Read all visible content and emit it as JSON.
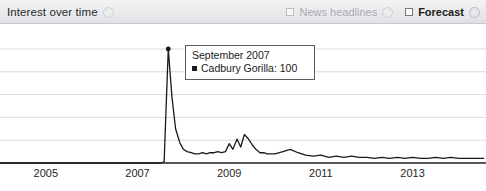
{
  "header": {
    "title": "Interest over time",
    "help_icon": "help-circle-icon",
    "controls": [
      {
        "name": "news-headlines",
        "label": "News headlines",
        "checked": false,
        "disabled": true,
        "help_icon": "help-circle-icon"
      },
      {
        "name": "forecast",
        "label": "Forecast",
        "checked": false,
        "disabled": false,
        "help_icon": "help-circle-icon"
      }
    ]
  },
  "tooltip": {
    "date": "September 2007",
    "series_label": "Cadbury Gorilla",
    "value": "100",
    "row_text": "Cadbury Gorilla: 100"
  },
  "colors": {
    "line": "#1a1a1a",
    "gridline": "#d9d9d9",
    "axis": "#222222",
    "header_bg": "#e9eaec",
    "tooltip_border": "#5d5d5d"
  },
  "chart_data": {
    "type": "line",
    "title": "Interest over time",
    "xlabel": "",
    "ylabel": "",
    "ylim": [
      0,
      100
    ],
    "xlim": [
      2004.0,
      2014.6
    ],
    "grid": true,
    "legend_position": "none",
    "xticks": [
      2005,
      2007,
      2009,
      2011,
      2013
    ],
    "xtick_labels": [
      "2005",
      "2007",
      "2009",
      "2011",
      "2013"
    ],
    "yticks": [
      0,
      20,
      40,
      60,
      80,
      100
    ],
    "annotation": {
      "x": 2007.67,
      "y": 100,
      "date": "September 2007",
      "text": "Cadbury Gorilla: 100"
    },
    "series": [
      {
        "name": "Cadbury Gorilla",
        "x": [
          2004.0,
          2004.25,
          2004.5,
          2004.75,
          2005.0,
          2005.25,
          2005.5,
          2005.75,
          2006.0,
          2006.25,
          2006.5,
          2006.75,
          2007.0,
          2007.17,
          2007.33,
          2007.5,
          2007.58,
          2007.67,
          2007.75,
          2007.83,
          2007.92,
          2008.0,
          2008.08,
          2008.17,
          2008.25,
          2008.33,
          2008.42,
          2008.5,
          2008.58,
          2008.67,
          2008.75,
          2008.83,
          2008.92,
          2009.0,
          2009.08,
          2009.17,
          2009.25,
          2009.33,
          2009.42,
          2009.5,
          2009.58,
          2009.67,
          2009.75,
          2009.83,
          2009.92,
          2010.0,
          2010.17,
          2010.33,
          2010.5,
          2010.67,
          2010.83,
          2011.0,
          2011.17,
          2011.33,
          2011.5,
          2011.67,
          2011.83,
          2012.0,
          2012.17,
          2012.33,
          2012.5,
          2012.67,
          2012.83,
          2013.0,
          2013.17,
          2013.33,
          2013.5,
          2013.67,
          2013.83,
          2014.0,
          2014.17,
          2014.33,
          2014.55
        ],
        "y": [
          0,
          0,
          0,
          0,
          0,
          0,
          0,
          0,
          0,
          0,
          0,
          0,
          0,
          0,
          0,
          0,
          1,
          100,
          58,
          30,
          18,
          12,
          10,
          9,
          8,
          8,
          9,
          8,
          9,
          9,
          10,
          9,
          10,
          17,
          12,
          21,
          14,
          25,
          21,
          16,
          12,
          9,
          9,
          8,
          8,
          8,
          10,
          12,
          9,
          7,
          6,
          7,
          5,
          6,
          5,
          6,
          5,
          5,
          4,
          5,
          4,
          5,
          4,
          5,
          4,
          4,
          5,
          4,
          5,
          4,
          4,
          4,
          4
        ]
      }
    ]
  },
  "footer": {
    "ghost_text": ""
  }
}
